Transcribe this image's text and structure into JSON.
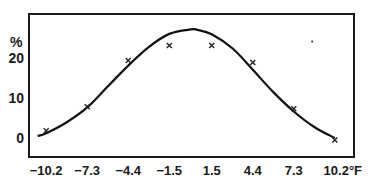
{
  "chart_data": {
    "type": "line",
    "title": "",
    "xlabel": "°F",
    "ylabel": "%",
    "x_tick_labels": [
      "-10.2",
      "-7.3",
      "-4.4",
      "-1.5",
      "1.5",
      "4.4",
      "7.3",
      "10.2°F"
    ],
    "y_tick_labels": [
      "0",
      "10",
      "20"
    ],
    "x": [
      -10.2,
      -7.3,
      -4.4,
      -1.5,
      1.5,
      4.4,
      7.3,
      10.2
    ],
    "xlim": [
      -11.3,
      11.3
    ],
    "ylim": [
      -4.5,
      31
    ],
    "grid": false,
    "legend": null,
    "series": [
      {
        "name": "observed",
        "style": "x-markers",
        "values": [
          1.8,
          7.8,
          19.3,
          23.0,
          23.0,
          18.8,
          7.3,
          -0.5
        ]
      },
      {
        "name": "fitted curve",
        "style": "smooth-line",
        "x": [
          -10.8,
          -10.2,
          -8.8,
          -7.3,
          -5.8,
          -4.4,
          -3.0,
          -1.5,
          0.0,
          0.5,
          1.5,
          3.0,
          4.4,
          5.8,
          7.3,
          8.8,
          10.2
        ],
        "values": [
          0.5,
          1.2,
          3.8,
          7.6,
          13.0,
          18.0,
          22.5,
          25.9,
          27.0,
          26.9,
          25.8,
          22.2,
          17.0,
          11.6,
          6.6,
          2.6,
          0.0
        ]
      }
    ],
    "annotations": [
      {
        "type": "dot",
        "x": 8.6,
        "y": 24.0
      }
    ]
  },
  "axes": {
    "y_unit": "%",
    "x_unit": "°F"
  }
}
